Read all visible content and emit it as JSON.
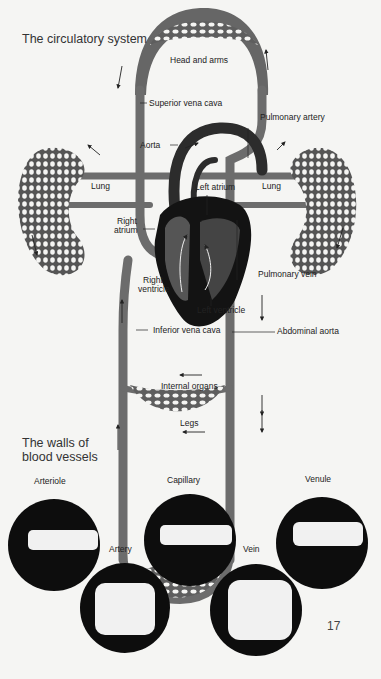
{
  "section1": {
    "title": "The circulatory system"
  },
  "labels": {
    "head_and_arms": "Head and arms",
    "superior_vena_cava": "Superior vena cava",
    "pulmonary_artery": "Pulmonary artery",
    "aorta": "Aorta",
    "lung_left": "Lung",
    "lung_right": "Lung",
    "left_atrium": "Left atrium",
    "right_atrium_line1": "Right",
    "right_atrium_line2": "atrium",
    "right_ventricle_line1": "Right",
    "right_ventricle_line2": "ventricle",
    "left_ventricle": "Left ventricle",
    "pulmonary_vein": "Pulmonary vein",
    "inferior_vena_cava": "Inferior vena cava",
    "abdominal_aorta": "Abdominal aorta",
    "internal_organs": "Internal organs",
    "legs": "Legs"
  },
  "section2": {
    "title_line1": "The walls of",
    "title_line2": "blood vessels",
    "vessels": [
      {
        "name": "Arteriole"
      },
      {
        "name": "Capillary"
      },
      {
        "name": "Venule"
      },
      {
        "name": "Artery"
      },
      {
        "name": "Vein"
      }
    ]
  },
  "page_number": "17",
  "colors": {
    "background": "#f5f5f3",
    "vein_gray": "#6e6e6e",
    "artery_dark": "#2a2a2a",
    "heart_black": "#111111",
    "text": "#222222"
  }
}
